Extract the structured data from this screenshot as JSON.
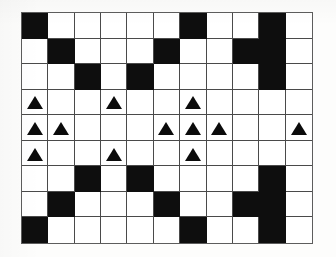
{
  "figure": {
    "icons": {
      "marker": "triangle-up-icon"
    },
    "colors": {
      "background": "#ffffff",
      "paper": "#fdfdfc",
      "filled_cell": "#0e0e0e",
      "grid_line": "#4a4a4a",
      "frame_line": "#5d5d5d",
      "marker": "#0b0b0b"
    }
  },
  "grid": {
    "columns": 11,
    "rows": 9,
    "cell_width_px": 26.5,
    "cell_height_px": 25.8,
    "legend": {
      "empty": "white cell",
      "filled": "black cell",
      "marker": "triangle"
    },
    "cells": [
      [
        "filled",
        "empty",
        "empty",
        "empty",
        "empty",
        "empty",
        "filled",
        "empty",
        "empty",
        "filled",
        "empty"
      ],
      [
        "empty",
        "filled",
        "empty",
        "empty",
        "empty",
        "filled",
        "empty",
        "empty",
        "filled",
        "filled",
        "empty"
      ],
      [
        "empty",
        "empty",
        "filled",
        "empty",
        "filled",
        "empty",
        "empty",
        "empty",
        "empty",
        "filled",
        "empty"
      ],
      [
        "marker",
        "empty",
        "empty",
        "marker",
        "empty",
        "empty",
        "marker",
        "empty",
        "empty",
        "empty",
        "empty"
      ],
      [
        "marker",
        "marker",
        "empty",
        "empty",
        "empty",
        "marker",
        "marker",
        "marker",
        "empty",
        "empty",
        "marker"
      ],
      [
        "marker",
        "empty",
        "empty",
        "marker",
        "empty",
        "empty",
        "marker",
        "empty",
        "empty",
        "empty",
        "empty"
      ],
      [
        "empty",
        "empty",
        "filled",
        "empty",
        "filled",
        "empty",
        "empty",
        "empty",
        "empty",
        "filled",
        "empty"
      ],
      [
        "empty",
        "filled",
        "empty",
        "empty",
        "empty",
        "filled",
        "empty",
        "empty",
        "filled",
        "filled",
        "empty"
      ],
      [
        "filled",
        "empty",
        "empty",
        "empty",
        "empty",
        "empty",
        "filled",
        "empty",
        "empty",
        "filled",
        "empty"
      ]
    ]
  }
}
